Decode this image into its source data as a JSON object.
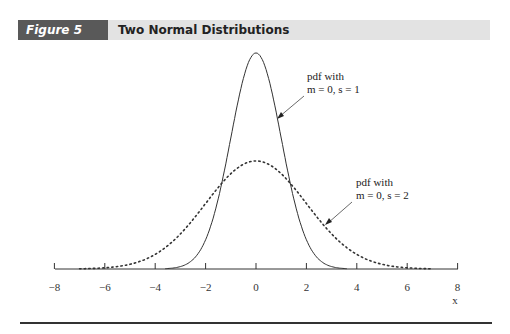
{
  "header": {
    "figure_tag": "Figure 5",
    "title": "Two Normal Distributions"
  },
  "chart_data": {
    "type": "line",
    "title": "Two Normal Distributions",
    "xlabel": "x",
    "ylabel": "",
    "xlim": [
      -8,
      8
    ],
    "x_ticks": [
      -8,
      -6,
      -4,
      -2,
      0,
      2,
      4,
      6,
      8
    ],
    "x_tick_labels": [
      "−8",
      "−6",
      "−4",
      "−2",
      "0",
      "2",
      "4",
      "6",
      "8"
    ],
    "grid": false,
    "series": [
      {
        "name": "pdf with m = 0, s = 1",
        "mean": 0,
        "sd": 1,
        "style": "solid",
        "peak_density": 0.399
      },
      {
        "name": "pdf with m = 0, s = 2",
        "mean": 0,
        "sd": 2,
        "style": "dotted",
        "peak_density": 0.199
      }
    ],
    "annotations": [
      {
        "line1": "pdf with",
        "line2": "m = 0, s = 1",
        "points_to": "solid curve near x = 0.9"
      },
      {
        "line1": "pdf with",
        "line2": "m = 0, s = 2",
        "points_to": "dotted curve near x = 2.8"
      }
    ]
  }
}
